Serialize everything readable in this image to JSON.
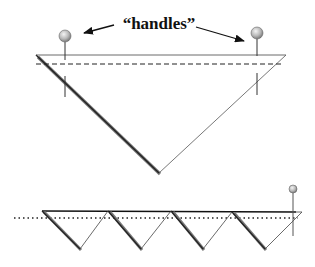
{
  "diagram": {
    "label": "“handles”",
    "colors": {
      "line": "#222222",
      "thin_line": "#444444",
      "shadow": "#777777",
      "ball_light": "#f2f2f2",
      "ball_dark": "#8a8a8a"
    },
    "top_figure": {
      "description": "large inverted triangle with two handles",
      "triangle": {
        "left": [
          36,
          55
        ],
        "right": [
          286,
          55
        ],
        "bottom": [
          159,
          173
        ]
      },
      "dashed_line_y": 64,
      "handles": [
        {
          "x": 65,
          "ball_y": 36,
          "radius": 6
        },
        {
          "x": 257,
          "ball_y": 33,
          "radius": 6
        }
      ]
    },
    "bottom_figure": {
      "description": "row of four inverted triangles with one handle",
      "top_y": 211,
      "bottom_y": 249,
      "tops_x": [
        42,
        108,
        171,
        232,
        302
      ],
      "bottoms_x": [
        80,
        141,
        203,
        265
      ],
      "dotted_line_y": 218,
      "handle": {
        "x": 293,
        "ball_y": 189,
        "radius": 4
      }
    }
  }
}
